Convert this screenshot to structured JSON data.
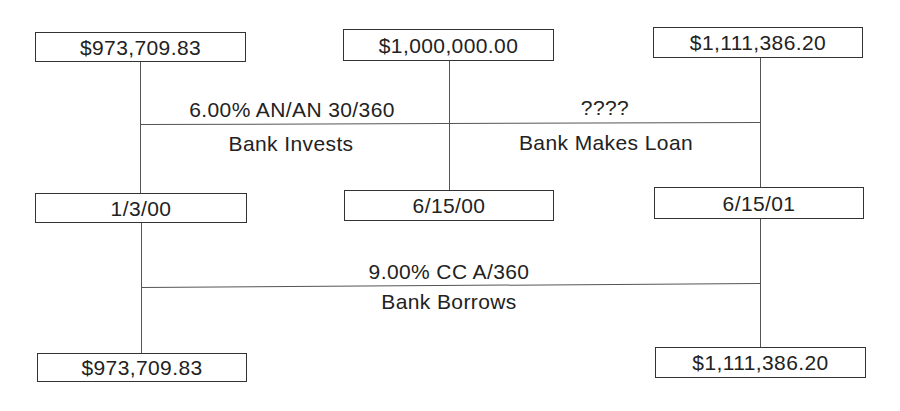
{
  "diagram": {
    "type": "cash-flow-timeline",
    "upper_timeline": {
      "start_amount": "$973,709.83",
      "mid_amount": "$1,000,000.00",
      "end_amount": "$1,111,386.20",
      "start_date": "1/3/00",
      "mid_date": "6/15/00",
      "end_date": "6/15/01",
      "segment_1": {
        "rate": "6.00% AN/AN 30/360",
        "description": "Bank Invests"
      },
      "segment_2": {
        "rate": "????",
        "description": "Bank Makes Loan"
      }
    },
    "lower_timeline": {
      "rate": "9.00% CC A/360",
      "description": "Bank Borrows",
      "start_amount": "$973,709.83",
      "end_amount": "$1,111,386.20"
    }
  }
}
